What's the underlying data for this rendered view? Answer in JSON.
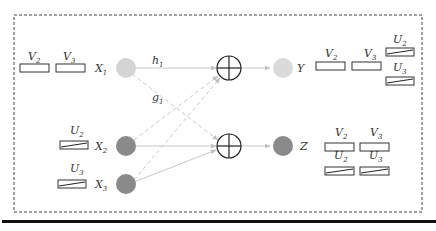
{
  "diagram": {
    "type": "causal-flow-diagram",
    "colors": {
      "border": "#444444",
      "light_node": "#d4d4d4",
      "dark_node": "#8a8a8a",
      "edge": "#c8c8c8",
      "rule": "#111111"
    },
    "inputs": [
      {
        "id": "X1",
        "base": "X",
        "sub": "1",
        "shade": "light",
        "boxes": [
          {
            "base": "V",
            "sub": "2",
            "style": "plain"
          },
          {
            "base": "V",
            "sub": "3",
            "style": "plain"
          }
        ]
      },
      {
        "id": "X2",
        "base": "X",
        "sub": "2",
        "shade": "dark",
        "boxes": [
          {
            "base": "U",
            "sub": "2",
            "style": "hatched"
          }
        ]
      },
      {
        "id": "X3",
        "base": "X",
        "sub": "3",
        "shade": "dark",
        "boxes": [
          {
            "base": "U",
            "sub": "3",
            "style": "hatched"
          }
        ]
      }
    ],
    "operators": [
      {
        "id": "sum_top",
        "symbol": "⊕"
      },
      {
        "id": "sum_bottom",
        "symbol": "⊕"
      }
    ],
    "outputs": [
      {
        "id": "Y",
        "label": "Y",
        "shade": "light",
        "boxes": [
          {
            "base": "V",
            "sub": "2",
            "style": "plain"
          },
          {
            "base": "V",
            "sub": "3",
            "style": "plain"
          },
          {
            "base": "U",
            "sub": "2",
            "style": "hatched"
          },
          {
            "base": "U",
            "sub": "3",
            "style": "hatched"
          }
        ]
      },
      {
        "id": "Z",
        "label": "Z",
        "shade": "dark",
        "boxes": [
          {
            "base": "V",
            "sub": "2",
            "style": "plain"
          },
          {
            "base": "V",
            "sub": "3",
            "style": "plain"
          },
          {
            "base": "U",
            "sub": "2",
            "style": "hatched"
          },
          {
            "base": "U",
            "sub": "3",
            "style": "hatched"
          }
        ]
      }
    ],
    "edges": [
      {
        "from": "X1",
        "to": "sum_top",
        "style": "solid",
        "label_base": "h",
        "label_sub": "1"
      },
      {
        "from": "X1",
        "to": "sum_bottom",
        "style": "dashed",
        "label_base": "g",
        "label_sub": "1"
      },
      {
        "from": "X2",
        "to": "sum_top",
        "style": "dashed"
      },
      {
        "from": "X3",
        "to": "sum_top",
        "style": "dashed"
      },
      {
        "from": "X2",
        "to": "sum_bottom",
        "style": "solid"
      },
      {
        "from": "X3",
        "to": "sum_bottom",
        "style": "solid"
      },
      {
        "from": "sum_top",
        "to": "Y",
        "style": "solid"
      },
      {
        "from": "sum_bottom",
        "to": "Z",
        "style": "solid"
      }
    ]
  },
  "text": {
    "V": "V",
    "U": "U",
    "X": "X",
    "h": "h",
    "g": "g",
    "s1": "1",
    "s2": "2",
    "s3": "3",
    "Y": "Y",
    "Z": "Z"
  }
}
